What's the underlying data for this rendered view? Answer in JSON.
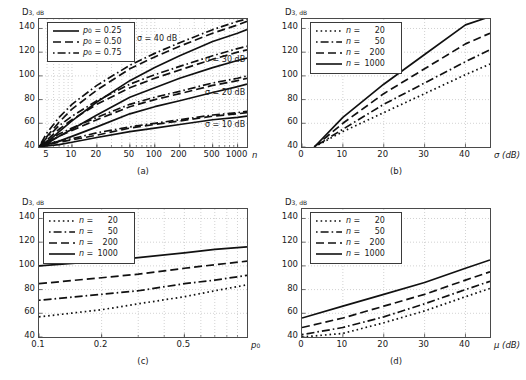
{
  "figure": {
    "width": 526,
    "height": 380,
    "background": "#ffffff",
    "line_color": "#111111",
    "grid_color": "#bfbfbf",
    "axis_color": "#4a4a4a"
  },
  "axis_titles": {
    "y_main": "D",
    "y_sub": "3, dB",
    "x_a": "n",
    "x_b": "σ (dB)",
    "x_c": "p",
    "x_c_sub": "0",
    "x_d": "μ (dB)"
  },
  "sublabels": {
    "a": "(a)",
    "b": "(b)",
    "c": "(c)",
    "d": "(d)"
  },
  "legend_a": {
    "entries": [
      {
        "label_var": "p",
        "label_sub": "0",
        "eq": "=",
        "value": "0.25",
        "style": "solid"
      },
      {
        "label_var": "p",
        "label_sub": "0",
        "eq": "=",
        "value": "0.50",
        "style": "dashed"
      },
      {
        "label_var": "p",
        "label_sub": "0",
        "eq": "=",
        "value": "0.75",
        "style": "dashdot"
      }
    ]
  },
  "legend_n": {
    "entries": [
      {
        "label_var": "n",
        "eq": "=",
        "value": "20",
        "style": "dotted"
      },
      {
        "label_var": "n",
        "eq": "=",
        "value": "50",
        "style": "dashdot"
      },
      {
        "label_var": "n",
        "eq": "=",
        "value": "200",
        "style": "dashed"
      },
      {
        "label_var": "n",
        "eq": "=",
        "value": "1000",
        "style": "solid"
      }
    ]
  },
  "annotations_a": [
    {
      "text": "σ = 40 dB"
    },
    {
      "text": "σ = 30 dB"
    },
    {
      "text": "σ = 20 dB"
    },
    {
      "text": "σ = 10 dB"
    }
  ],
  "ticks": {
    "y": [
      "40",
      "60",
      "80",
      "100",
      "120",
      "140"
    ],
    "x_a": [
      "5",
      "10",
      "20",
      "50",
      "100",
      "200",
      "500",
      "1000"
    ],
    "x_b": [
      "0",
      "10",
      "20",
      "30",
      "40"
    ],
    "x_c": [
      "0.1",
      "0.2",
      "0.5"
    ],
    "x_d": [
      "0",
      "10",
      "20",
      "30",
      "40"
    ]
  },
  "chart_data": [
    {
      "type": "line",
      "panel": "(a)",
      "title": "",
      "xlabel": "n",
      "ylabel": "D3, dB",
      "xscale": "log",
      "xlim": [
        4,
        1300
      ],
      "ylim": [
        40,
        148
      ],
      "xticks": [
        5,
        10,
        20,
        50,
        100,
        200,
        500,
        1000
      ],
      "yticks": [
        40,
        60,
        80,
        100,
        120,
        140
      ],
      "grid": true,
      "legend_position": "upper-left",
      "annotations": [
        "σ = 40 dB",
        "σ = 30 dB",
        "σ = 20 dB",
        "σ = 10 dB"
      ],
      "x": [
        4,
        5,
        7,
        10,
        20,
        50,
        100,
        200,
        500,
        1000,
        1300
      ],
      "series": [
        {
          "name": "σ=40 dB, p0=0.25",
          "style": "solid",
          "values": [
            40,
            44,
            53,
            62,
            78,
            96,
            107,
            117,
            129,
            136,
            139
          ]
        },
        {
          "name": "σ=40 dB, p0=0.50",
          "style": "dashed",
          "values": [
            40,
            49,
            61,
            72,
            88,
            106,
            116,
            125,
            136,
            143,
            146
          ]
        },
        {
          "name": "σ=40 dB, p0=0.75",
          "style": "dashdot",
          "values": [
            40,
            52,
            65,
            76,
            92,
            109,
            119,
            128,
            139,
            146,
            148
          ]
        },
        {
          "name": "σ=30 dB, p0=0.25",
          "style": "solid",
          "values": [
            40,
            43,
            49,
            55,
            67,
            82,
            90,
            98,
            107,
            113,
            115
          ]
        },
        {
          "name": "σ=30 dB, p0=0.50",
          "style": "dashed",
          "values": [
            40,
            46,
            55,
            63,
            76,
            90,
            98,
            105,
            114,
            120,
            122
          ]
        },
        {
          "name": "σ=30 dB, p0=0.75",
          "style": "dashdot",
          "values": [
            40,
            48,
            58,
            66,
            79,
            93,
            101,
            108,
            117,
            123,
            125
          ]
        },
        {
          "name": "σ=20 dB, p0=0.25",
          "style": "solid",
          "values": [
            40,
            42,
            45,
            49,
            57,
            68,
            74,
            79,
            86,
            91,
            93
          ]
        },
        {
          "name": "σ=20 dB, p0=0.50",
          "style": "dashed",
          "values": [
            40,
            44,
            49,
            54,
            63,
            74,
            80,
            85,
            92,
            96,
            98
          ]
        },
        {
          "name": "σ=20 dB, p0=0.75",
          "style": "dashdot",
          "values": [
            40,
            45,
            51,
            56,
            65,
            76,
            82,
            87,
            94,
            98,
            100
          ]
        },
        {
          "name": "σ=10 dB, p0=0.25",
          "style": "solid",
          "values": [
            40,
            41,
            42,
            44,
            48,
            53,
            56,
            59,
            63,
            65,
            66
          ]
        },
        {
          "name": "σ=10 dB, p0=0.50",
          "style": "dashed",
          "values": [
            40,
            42,
            44,
            46,
            50,
            56,
            59,
            62,
            66,
            68,
            69
          ]
        },
        {
          "name": "σ=10 dB, p0=0.75",
          "style": "dashdot",
          "values": [
            40,
            43,
            45,
            47,
            52,
            57,
            60,
            63,
            67,
            69,
            70
          ]
        }
      ]
    },
    {
      "type": "line",
      "panel": "(b)",
      "title": "",
      "xlabel": "σ (dB)",
      "ylabel": "D3, dB",
      "xscale": "linear",
      "xlim": [
        0,
        46
      ],
      "ylim": [
        40,
        148
      ],
      "xticks": [
        0,
        10,
        20,
        30,
        40
      ],
      "yticks": [
        40,
        60,
        80,
        100,
        120,
        140
      ],
      "grid": true,
      "legend_position": "upper-left",
      "x": [
        3,
        10,
        20,
        30,
        40,
        46
      ],
      "series": [
        {
          "name": "n = 20",
          "style": "dotted",
          "values": [
            40,
            53,
            69,
            85,
            101,
            110
          ]
        },
        {
          "name": "n = 50",
          "style": "dashdot",
          "values": [
            40,
            55,
            76,
            94,
            112,
            122
          ]
        },
        {
          "name": "n = 200",
          "style": "dashed",
          "values": [
            40,
            60,
            85,
            106,
            127,
            136
          ]
        },
        {
          "name": "n = 1000",
          "style": "solid",
          "values": [
            40,
            65,
            93,
            118,
            143,
            150
          ]
        }
      ]
    },
    {
      "type": "line",
      "panel": "(c)",
      "title": "",
      "xlabel": "p0",
      "ylabel": "D3, dB",
      "xscale": "log",
      "xlim": [
        0.1,
        1.0
      ],
      "ylim": [
        40,
        148
      ],
      "xticks": [
        0.1,
        0.2,
        0.5
      ],
      "yticks": [
        40,
        60,
        80,
        100,
        120,
        140
      ],
      "grid": true,
      "legend_position": "upper-left",
      "x": [
        0.1,
        0.2,
        0.3,
        0.5,
        0.7,
        1.0
      ],
      "series": [
        {
          "name": "n = 20",
          "style": "dotted",
          "values": [
            57,
            63,
            68,
            74,
            79,
            84
          ]
        },
        {
          "name": "n = 50",
          "style": "dashdot",
          "values": [
            71,
            76,
            79,
            85,
            88,
            92
          ]
        },
        {
          "name": "n = 200",
          "style": "dashed",
          "values": [
            85,
            90,
            93,
            98,
            101,
            104
          ]
        },
        {
          "name": "n = 1000",
          "style": "solid",
          "values": [
            100,
            104,
            107,
            111,
            114,
            116
          ]
        }
      ]
    },
    {
      "type": "line",
      "panel": "(d)",
      "title": "",
      "xlabel": "μ (dB)",
      "ylabel": "D3, dB",
      "xscale": "linear",
      "xlim": [
        0,
        46
      ],
      "ylim": [
        40,
        148
      ],
      "xticks": [
        0,
        10,
        20,
        30,
        40
      ],
      "yticks": [
        40,
        60,
        80,
        100,
        120,
        140
      ],
      "grid": true,
      "legend_position": "upper-left",
      "x": [
        0,
        10,
        20,
        30,
        40,
        46
      ],
      "series": [
        {
          "name": "n = 20",
          "style": "dotted",
          "values": [
            40,
            43,
            52,
            62,
            74,
            81
          ]
        },
        {
          "name": "n = 50",
          "style": "dashdot",
          "values": [
            42,
            48,
            57,
            68,
            80,
            87
          ]
        },
        {
          "name": "n = 200",
          "style": "dashed",
          "values": [
            48,
            56,
            66,
            76,
            88,
            95
          ]
        },
        {
          "name": "n = 1000",
          "style": "solid",
          "values": [
            56,
            66,
            76,
            86,
            98,
            105
          ]
        }
      ]
    }
  ]
}
